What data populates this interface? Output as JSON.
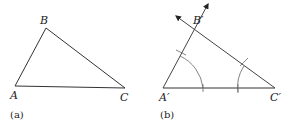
{
  "figure_a": {
    "caption": "(a)",
    "vertices": {
      "A": "A",
      "B": "B",
      "C": "C"
    }
  },
  "figure_b": {
    "caption": "(b)",
    "vertices": {
      "A": "A′",
      "B": "B′",
      "C": "C′"
    }
  },
  "colors": {
    "line": "#333333",
    "arc": "#555555"
  }
}
